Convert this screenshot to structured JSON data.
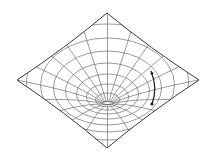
{
  "diagram": {
    "colors": {
      "background": "#ffffff",
      "grid": "#6e6e6e",
      "outline": "#3a3a3a",
      "arrow": "#222222"
    },
    "diamond": {
      "top": [
        107,
        13
      ],
      "right": [
        199,
        80
      ],
      "bottom": [
        107,
        148
      ],
      "left": [
        17,
        80
      ]
    },
    "throat": {
      "cx": 107.5,
      "cy": 103,
      "rx": 5,
      "ry": 1.5
    },
    "rings": [
      {
        "cx": 107.5,
        "cy": 100,
        "rx": 12,
        "ry": 7
      },
      {
        "cx": 107.5,
        "cy": 97,
        "rx": 21,
        "ry": 13
      },
      {
        "cx": 107.5,
        "cy": 94,
        "rx": 31,
        "ry": 20
      },
      {
        "cx": 107.5,
        "cy": 91,
        "rx": 42,
        "ry": 28
      },
      {
        "cx": 107.5,
        "cy": 88,
        "rx": 54,
        "ry": 37
      },
      {
        "cx": 107.5,
        "cy": 85,
        "rx": 67,
        "ry": 47
      },
      {
        "cx": 107.5,
        "cy": 82,
        "rx": 81,
        "ry": 58
      }
    ],
    "radial_count": 20,
    "arrow": {
      "from": [
        151,
        71
      ],
      "ctrl": [
        158,
        88
      ],
      "to": [
        152,
        104
      ]
    }
  }
}
